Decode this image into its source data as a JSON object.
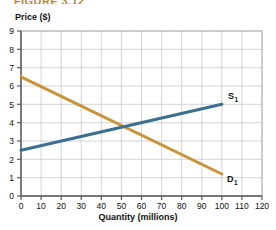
{
  "figure": {
    "caption": "FIGURE 3.12",
    "caption_color": "#b8893f"
  },
  "axes": {
    "y_title": "Price ($)",
    "x_title": "Quantity (millions)",
    "y_ticks": [
      "0",
      "1",
      "2",
      "3",
      "4",
      "5",
      "6",
      "7",
      "8",
      "9"
    ],
    "x_ticks": [
      "0",
      "10",
      "20",
      "30",
      "40",
      "50",
      "60",
      "70",
      "80",
      "90",
      "100",
      "110",
      "120"
    ]
  },
  "labels": {
    "supply": {
      "base": "S",
      "sub": "1"
    },
    "demand": {
      "base": "D",
      "sub": "1"
    }
  },
  "chart_data": {
    "type": "line",
    "title": "FIGURE 3.12",
    "xlabel": "Quantity (millions)",
    "ylabel": "Price ($)",
    "xlim": [
      0,
      120
    ],
    "ylim": [
      0,
      9
    ],
    "xticks": [
      0,
      10,
      20,
      30,
      40,
      50,
      60,
      70,
      80,
      90,
      100,
      110,
      120
    ],
    "yticks": [
      0,
      1,
      2,
      3,
      4,
      5,
      6,
      7,
      8,
      9
    ],
    "grid": true,
    "legend": "inline-curve-labels",
    "series": [
      {
        "name": "S1",
        "label": "S₁",
        "color": "#3b6f8f",
        "x": [
          0,
          100
        ],
        "y": [
          2.5,
          5.0
        ],
        "description": "Supply curve, upward sloping"
      },
      {
        "name": "D1",
        "label": "D₁",
        "color": "#c99338",
        "x": [
          0,
          100
        ],
        "y": [
          6.5,
          1.2
        ],
        "description": "Demand curve, downward sloping"
      }
    ],
    "annotations": [
      {
        "text": "Equilibrium",
        "x": 50,
        "y": 3.8,
        "visible": false
      }
    ]
  },
  "colors": {
    "supply": "#3b6f8f",
    "demand": "#c99338",
    "grid": "#c9c9c9",
    "axis": "#5a5a5a",
    "text": "#111111"
  }
}
